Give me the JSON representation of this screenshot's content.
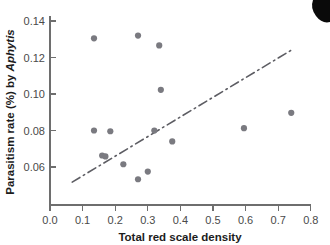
{
  "figure": {
    "background_color": "#ffffff",
    "point_color": "#7a7a80",
    "line_color": "#5d5d63",
    "axis_color": "#6e6e6e"
  },
  "axes": {
    "x_title": "Total red scale density",
    "y_title_plain": "Parasitism rate (%) by ",
    "y_title_italic": "Aphytis",
    "x_ticks": [
      "0.0",
      "0.1",
      "0.2",
      "0.3",
      "0.4",
      "0.5",
      "0.6",
      "0.7",
      "0.8"
    ],
    "y_ticks": [
      "0.06",
      "0.08",
      "0.10",
      "0.12",
      "0.14"
    ]
  },
  "chart_data": {
    "type": "scatter",
    "title": "",
    "xlabel": "Total red scale density",
    "ylabel": "Parasitism rate (%) by Aphytis",
    "xlim": [
      0.0,
      0.8
    ],
    "ylim": [
      0.046,
      0.14
    ],
    "xticks": [
      0.0,
      0.1,
      0.2,
      0.3,
      0.4,
      0.5,
      0.6,
      0.7,
      0.8
    ],
    "yticks": [
      0.06,
      0.08,
      0.1,
      0.12,
      0.14
    ],
    "grid": false,
    "legend": "none",
    "marker": "filled-circle",
    "points": [
      {
        "x": 0.135,
        "y": 0.1305
      },
      {
        "x": 0.27,
        "y": 0.132
      },
      {
        "x": 0.335,
        "y": 0.1266
      },
      {
        "x": 0.34,
        "y": 0.1023
      },
      {
        "x": 0.135,
        "y": 0.08
      },
      {
        "x": 0.185,
        "y": 0.0796
      },
      {
        "x": 0.32,
        "y": 0.08
      },
      {
        "x": 0.375,
        "y": 0.074
      },
      {
        "x": 0.595,
        "y": 0.0813
      },
      {
        "x": 0.74,
        "y": 0.0897
      },
      {
        "x": 0.16,
        "y": 0.0663
      },
      {
        "x": 0.17,
        "y": 0.0658
      },
      {
        "x": 0.225,
        "y": 0.0615
      },
      {
        "x": 0.3,
        "y": 0.0575
      },
      {
        "x": 0.27,
        "y": 0.0533
      }
    ],
    "trend_line": {
      "style": "dash-dot",
      "x_start": 0.068,
      "y_start": 0.057,
      "x_end": 0.745,
      "y_end": 0.1295
    }
  }
}
